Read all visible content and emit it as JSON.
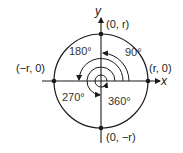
{
  "diagram": {
    "type": "unit-circle-angles",
    "axes": {
      "x_label": "x",
      "y_label": "y"
    },
    "points": [
      {
        "label": "(0, r)",
        "position": "top"
      },
      {
        "label": "(r, 0)",
        "position": "right"
      },
      {
        "label": "(−r, 0)",
        "position": "left"
      },
      {
        "label": "(0, −r)",
        "position": "bottom"
      }
    ],
    "angles": [
      {
        "label": "90°"
      },
      {
        "label": "180°"
      },
      {
        "label": "270°"
      },
      {
        "label": "360°"
      }
    ],
    "colors": {
      "stroke": "#1a1a1a",
      "background": "#ffffff"
    }
  }
}
